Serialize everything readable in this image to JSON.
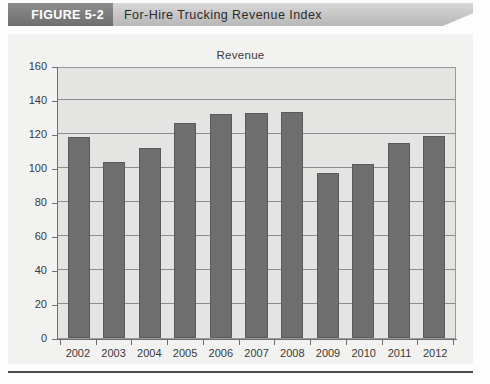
{
  "figure": {
    "number_label": "FIGURE 5-2",
    "title": "For-Hire Trucking Revenue Index"
  },
  "source_note": "",
  "chart_data": {
    "type": "bar",
    "title": "Revenue",
    "xlabel": "",
    "ylabel": "",
    "ylim": [
      0,
      160
    ],
    "ytick_step": 20,
    "yticks": [
      160,
      140,
      120,
      100,
      80,
      60,
      40,
      20,
      0
    ],
    "grid": true,
    "legend": "none",
    "bar_color": "#6e6e6e",
    "plot_background": "#e4e4e2",
    "panel_background": "#f2f2f0",
    "categories": [
      "2002",
      "2003",
      "2004",
      "2005",
      "2006",
      "2007",
      "2008",
      "2009",
      "2010",
      "2011",
      "2012"
    ],
    "values": [
      118.5,
      103.5,
      112,
      126.5,
      131.5,
      132.5,
      133,
      97,
      102.5,
      114.5,
      119
    ]
  }
}
